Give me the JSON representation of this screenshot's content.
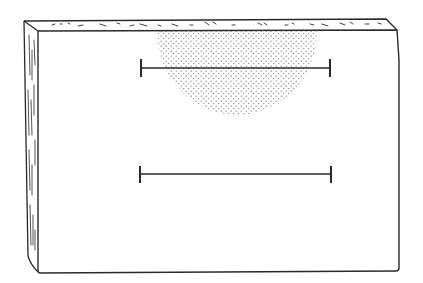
{
  "figure": {
    "colors": {
      "background": "#ffffff",
      "ink": "#2a2a2a",
      "stipple": "#7a7a7a"
    },
    "board": {
      "front_face": {
        "x1": 38,
        "y1": 31,
        "x2": 399,
        "y2": 272
      },
      "top_edge_back_y": 19,
      "side_edge_left_x": 24
    },
    "stippled_region": {
      "shape": "semicircle",
      "cx": 237,
      "top_y": 31,
      "rx": 80,
      "ry": 84
    },
    "bars": [
      {
        "name": "upper-bar",
        "x1": 141,
        "x2": 330,
        "y": 68
      },
      {
        "name": "lower-bar",
        "x1": 140,
        "x2": 331,
        "y": 174
      }
    ]
  }
}
